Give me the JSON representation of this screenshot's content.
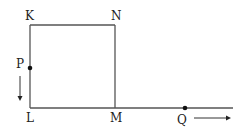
{
  "labels": {
    "K": "K",
    "N": "N",
    "P": "P",
    "L": "L",
    "M": "M",
    "Q": "Q"
  },
  "colors": {
    "line": "#555555",
    "dot": "#111111"
  }
}
